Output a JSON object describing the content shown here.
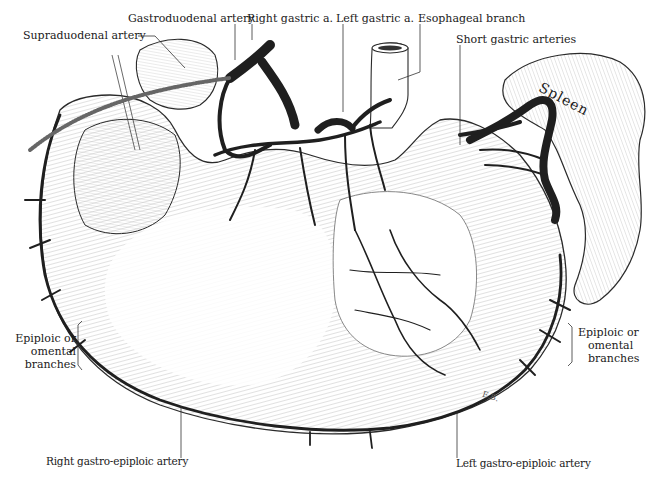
{
  "figure": {
    "colors": {
      "artery": "#1f1f1f",
      "outline": "#2a2a2a",
      "hatch": "#8a8a8a",
      "background": "#ffffff",
      "label": "#1a1a1a"
    }
  },
  "labels": {
    "gastroduodenal": "Gastroduodenal artery",
    "right_gastric": "Right gastric a.",
    "left_gastric": "Left gastric a.",
    "esophageal_branch": "Esophageal branch",
    "supraduodenal": "Supraduodenal artery",
    "short_gastric": "Short gastric arteries",
    "epiploic_left": [
      "Epiploic or",
      "omental",
      "branches"
    ],
    "epiploic_right": [
      "Epiploic or",
      "omental",
      "branches"
    ],
    "right_gastro_epiploic": "Right gastro-epiploic artery",
    "left_gastro_epiploic": "Left gastro-epiploic artery"
  },
  "organs": {
    "spleen": "Spleen"
  },
  "signature": "E.B."
}
